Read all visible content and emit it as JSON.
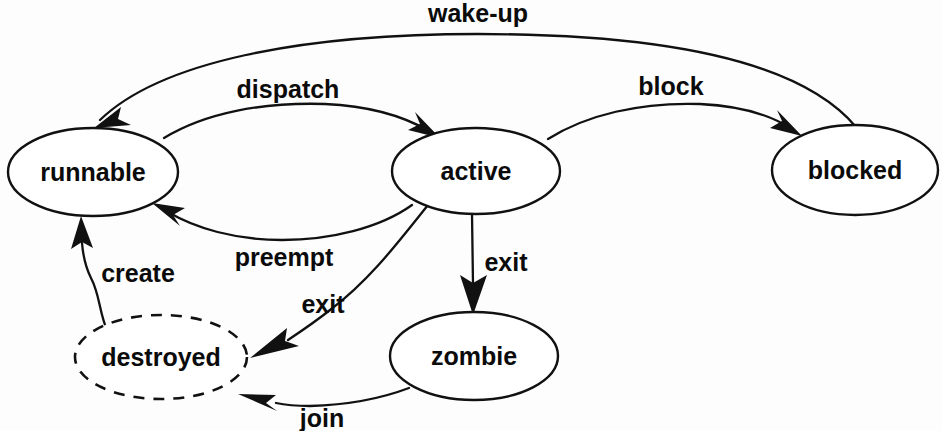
{
  "diagram": {
    "type": "state-machine",
    "background_color": "#fdfdfd",
    "stroke_color": "#111111",
    "text_color": "#0b0b0b",
    "nodes": [
      {
        "id": "runnable",
        "label": "runnable",
        "shape": "ellipse",
        "border": "solid",
        "cx": 93,
        "cy": 172,
        "rx": 85,
        "ry": 44
      },
      {
        "id": "active",
        "label": "active",
        "shape": "ellipse",
        "border": "solid",
        "cx": 476,
        "cy": 171,
        "rx": 84,
        "ry": 43
      },
      {
        "id": "blocked",
        "label": "blocked",
        "shape": "ellipse",
        "border": "solid",
        "cx": 855,
        "cy": 170,
        "rx": 83,
        "ry": 45
      },
      {
        "id": "destroyed",
        "label": "destroyed",
        "shape": "ellipse",
        "border": "dashed",
        "cx": 161,
        "cy": 357,
        "rx": 86,
        "ry": 42
      },
      {
        "id": "zombie",
        "label": "zombie",
        "shape": "ellipse",
        "border": "solid",
        "cx": 474,
        "cy": 356,
        "rx": 84,
        "ry": 44
      }
    ],
    "edges": [
      {
        "id": "wake-up",
        "label": "wake-up",
        "from": "blocked",
        "to": "runnable",
        "label_x": 478,
        "label_y": 15
      },
      {
        "id": "dispatch",
        "label": "dispatch",
        "from": "runnable",
        "to": "active",
        "label_x": 288,
        "label_y": 91
      },
      {
        "id": "block",
        "label": "block",
        "from": "active",
        "to": "blocked",
        "label_x": 671,
        "label_y": 88
      },
      {
        "id": "preempt",
        "label": "preempt",
        "from": "active",
        "to": "runnable",
        "label_x": 284,
        "label_y": 259
      },
      {
        "id": "create",
        "label": "create",
        "from": "destroyed",
        "to": "runnable",
        "label_x": 138,
        "label_y": 275
      },
      {
        "id": "exit-destroyed",
        "label": "exit",
        "from": "active",
        "to": "destroyed",
        "label_x": 323,
        "label_y": 306
      },
      {
        "id": "exit-zombie",
        "label": "exit",
        "from": "active",
        "to": "zombie",
        "label_x": 506,
        "label_y": 264
      },
      {
        "id": "join",
        "label": "join",
        "from": "zombie",
        "to": "destroyed",
        "label_x": 322,
        "label_y": 420
      }
    ]
  }
}
